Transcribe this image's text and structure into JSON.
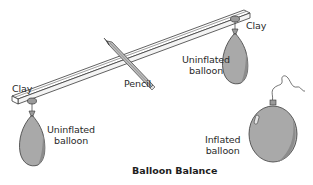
{
  "diagram": {
    "title": "Balloon Balance",
    "labels": {
      "clay_left": "Clay",
      "clay_right": "Clay",
      "pencil": "Pencil",
      "uninflated_left_line1": "Uninflated",
      "uninflated_left_line2": "balloon",
      "uninflated_right_line1": "Uninflated",
      "uninflated_right_line2": "balloon",
      "inflated_line1": "Inflated",
      "inflated_line2": "balloon"
    },
    "colors": {
      "balloon_fill": "#a9a9a9",
      "balloon_shade": "#8c8c8c",
      "outline": "#3a3a3a",
      "background": "#ffffff"
    }
  }
}
